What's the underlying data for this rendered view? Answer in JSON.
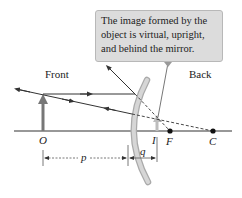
{
  "callout": {
    "lines": [
      "The image formed by the",
      "object is virtual, upright,",
      "and behind the mirror."
    ]
  },
  "labels": {
    "front": "Front",
    "back": "Back",
    "object": "O",
    "image": "I",
    "focal_point": "F",
    "center": "C",
    "object_distance": "p",
    "image_distance": "q"
  },
  "colors": {
    "mirror": "#c8c8c8",
    "callout_bg": "#dcdcdc",
    "object_arrow": "#777777",
    "image_arrow": "#bdbdbd",
    "ray": "#333333"
  }
}
